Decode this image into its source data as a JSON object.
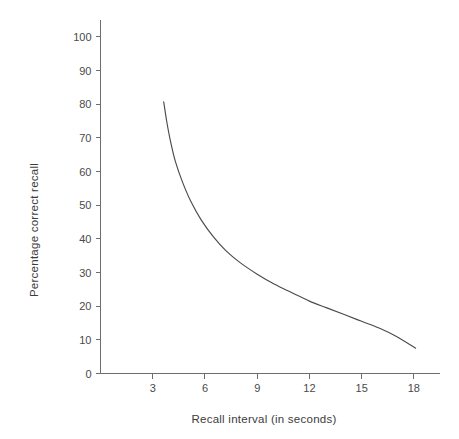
{
  "chart_data": {
    "type": "line",
    "title": "",
    "subtitle": "",
    "xlabel": "Recall interval (in seconds)",
    "ylabel": "Percentage correct recall",
    "xlim": [
      0,
      19.5
    ],
    "ylim": [
      0,
      105
    ],
    "grid": false,
    "legend": null,
    "legend_position": "none",
    "x_ticks": [
      3,
      6,
      9,
      12,
      15,
      18
    ],
    "x_tick_labels": [
      "3",
      "6",
      "9",
      "12",
      "15",
      "18"
    ],
    "y_ticks": [
      0,
      10,
      20,
      30,
      40,
      50,
      60,
      70,
      80,
      90,
      100
    ],
    "y_tick_labels": [
      "0",
      "10",
      "20",
      "30",
      "40",
      "50",
      "60",
      "70",
      "80",
      "90",
      "100"
    ],
    "series": [
      {
        "name": "Percentage correct recall",
        "color": "#4b4b4b",
        "x": [
          3.63,
          3.8,
          4.0,
          4.3,
          4.7,
          5.2,
          5.8,
          6.5,
          7.2,
          8.0,
          9.0,
          10.0,
          11.0,
          12.0,
          13.0,
          14.0,
          15.0,
          16.0,
          17.0,
          18.1
        ],
        "y": [
          80.7,
          75.0,
          69.5,
          63.0,
          57.0,
          51.0,
          45.5,
          40.5,
          36.5,
          33.0,
          29.5,
          26.5,
          24.0,
          21.5,
          19.5,
          17.5,
          15.5,
          13.5,
          11.0,
          7.5
        ]
      }
    ],
    "annotations": []
  },
  "axes": {
    "x_axis_label": "Recall interval (in seconds)",
    "y_axis_label": "Percentage correct recall"
  },
  "colors": {
    "curve": "#4b4b4b",
    "axis": "#6d6d6d",
    "text": "#3c3c3c",
    "background": "#ffffff"
  }
}
